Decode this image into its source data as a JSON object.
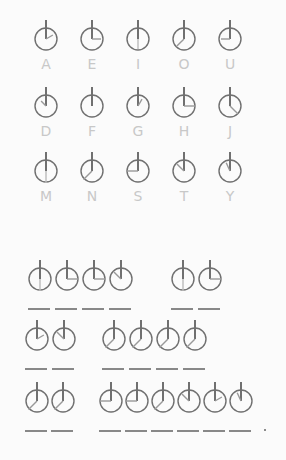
{
  "key": {
    "rows": [
      [
        {
          "letter": "A",
          "hand": "a"
        },
        {
          "letter": "E",
          "hand": "e"
        },
        {
          "letter": "I",
          "hand": "i"
        },
        {
          "letter": "O",
          "hand": "o"
        },
        {
          "letter": "U",
          "hand": "u"
        }
      ],
      [
        {
          "letter": "D",
          "hand": "d"
        },
        {
          "letter": "F",
          "hand": "f"
        },
        {
          "letter": "G",
          "hand": "g"
        },
        {
          "letter": "H",
          "hand": "h"
        },
        {
          "letter": "J",
          "hand": "j"
        }
      ],
      [
        {
          "letter": "M",
          "hand": "m"
        },
        {
          "letter": "N",
          "hand": "n"
        },
        {
          "letter": "S",
          "hand": "s"
        },
        {
          "letter": "T",
          "hand": "t"
        },
        {
          "letter": "Y",
          "hand": "y"
        }
      ]
    ]
  },
  "message": {
    "lines": [
      {
        "words": [
          [
            "m",
            "h",
            "h",
            "t"
          ],
          [
            "m",
            "h"
          ]
        ]
      },
      {
        "words": [
          [
            "a",
            "t"
          ],
          [
            "n",
            "n",
            "n",
            "n"
          ]
        ]
      },
      {
        "words": [
          [
            "n",
            "n"
          ],
          [
            "s",
            "s",
            "n",
            "t",
            "a",
            "y"
          ]
        ]
      }
    ],
    "ends_with_period": true
  },
  "colors": {
    "ink": "#707070",
    "letter": "#c8c8c8",
    "blank": "#888888"
  }
}
